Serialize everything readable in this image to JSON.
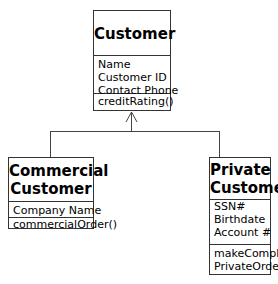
{
  "diagram": {
    "type": "UML class diagram",
    "classes": {
      "customer": {
        "name": "Customer",
        "attributes": [
          "Name",
          "Customer ID",
          "Contact Phone"
        ],
        "operations": [
          "creditRating()"
        ]
      },
      "commercial": {
        "name_line1": "Commercial",
        "name_line2": "Customer",
        "attributes": [
          "Company Name"
        ],
        "operations": [
          "commercialOrder()"
        ]
      },
      "private": {
        "name_line1": "Private",
        "name_line2": "Customer",
        "attributes": [
          "SSN#",
          "Birthdate",
          "Account #"
        ],
        "operations": [
          "makeComplaint()",
          "PrivateOrder()"
        ]
      }
    },
    "relationships": [
      {
        "type": "generalization",
        "from": "Commercial Customer",
        "to": "Customer"
      },
      {
        "type": "generalization",
        "from": "Private Customer",
        "to": "Customer"
      }
    ]
  }
}
